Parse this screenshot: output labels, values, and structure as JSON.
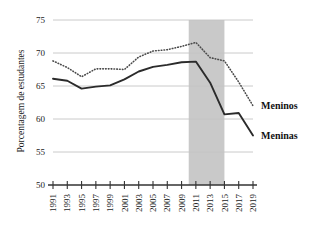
{
  "chart_data": {
    "type": "line",
    "title": "",
    "subtitle": "",
    "xlabel": "",
    "ylabel": "Porcentagem de estudantes",
    "ylim": [
      50,
      75
    ],
    "xlim": [
      1991,
      2019
    ],
    "yticks": [
      50,
      55,
      60,
      65,
      70,
      75
    ],
    "grid": "horizontal",
    "legend_position": "right-inline",
    "x": [
      1991,
      1993,
      1995,
      1997,
      1999,
      2001,
      2003,
      2005,
      2007,
      2009,
      2011,
      2013,
      2015,
      2017,
      2019
    ],
    "xtick_labels": [
      "1991",
      "1993",
      "1995",
      "1997",
      "1999",
      "2001",
      "2003",
      "2005",
      "2007",
      "2009",
      "2011",
      "2013",
      "2015",
      "2017",
      "2019"
    ],
    "series": [
      {
        "name": "Meninos",
        "style": "dotted",
        "color": "#4a4a4a",
        "values": [
          68.8,
          67.8,
          66.4,
          67.6,
          67.6,
          67.5,
          69.4,
          70.3,
          70.5,
          71.0,
          71.6,
          69.3,
          68.8,
          65.6,
          62.0
        ]
      },
      {
        "name": "Meninas",
        "style": "solid",
        "color": "#2b2b2b",
        "values": [
          66.1,
          65.8,
          64.6,
          64.9,
          65.1,
          66.0,
          67.2,
          67.9,
          68.2,
          68.6,
          68.7,
          65.5,
          60.7,
          60.9,
          57.5
        ]
      }
    ],
    "shaded_region": {
      "x_start": 2010,
      "x_end": 2015,
      "color": "#c9c9c9"
    },
    "annotations": [
      {
        "text": "Meninos",
        "series": "Meninos"
      },
      {
        "text": "Meninas",
        "series": "Meninas"
      }
    ]
  },
  "colors": {
    "background": "#ffffff",
    "axis": "#333333",
    "gridline": "#c4c4c4",
    "shade": "#c9c9c9",
    "text": "#1a1a1a"
  }
}
